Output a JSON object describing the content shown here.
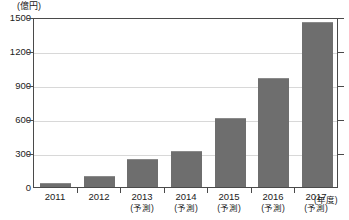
{
  "chart_data": {
    "type": "bar",
    "title": "",
    "subtitle": "",
    "unit_label": "(億円)",
    "xlabel": "(年度)",
    "ylabel": "",
    "ylim": [
      0,
      1500
    ],
    "ytick_labels": [
      "1500",
      "1200",
      "900",
      "600",
      "300",
      "0"
    ],
    "ytick_values": [
      1500,
      1200,
      900,
      600,
      300,
      0
    ],
    "grid": true,
    "legend": "none",
    "bar_color": "#6e6e6e",
    "axis_color": "#4a4a4a",
    "grid_color": "#d8d8d8",
    "categories": [
      "2011",
      "2012",
      "2013",
      "2014",
      "2015",
      "2016",
      "2017"
    ],
    "category_notes": [
      "",
      "",
      "(予測)",
      "(予測)",
      "(予測)",
      "(予測)",
      "(予測)"
    ],
    "values": [
      35,
      100,
      245,
      320,
      610,
      960,
      1460
    ],
    "series": [
      {
        "name": "市場規模",
        "values": [
          35,
          100,
          245,
          320,
          610,
          960,
          1460
        ]
      }
    ],
    "annotations": []
  }
}
